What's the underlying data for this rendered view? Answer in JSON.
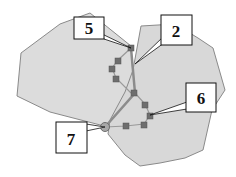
{
  "diagram": {
    "colors": {
      "region_fill": "#dcdcdc",
      "region_stroke": "#8a8a8a",
      "path_main": "#8c8c8c",
      "path_thin": "#9a9a9a",
      "node_fill": "#6e6e6e",
      "label_bg": "#ffffff",
      "label_border": "#111111"
    },
    "labels": [
      {
        "id": "label-5",
        "text": "5"
      },
      {
        "id": "label-2",
        "text": "2"
      },
      {
        "id": "label-6",
        "text": "6"
      },
      {
        "id": "label-7",
        "text": "7"
      }
    ]
  }
}
